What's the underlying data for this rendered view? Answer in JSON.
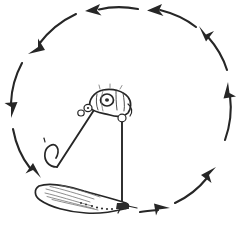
{
  "figure": {
    "title": "Hand-drawn illustration of a suspended artificial fly with a circular arrow diagram",
    "background_color": "#ffffff",
    "ink_color": "#262626",
    "shading_color": "#6a6a6a",
    "canvas": {
      "width": 242,
      "height": 229
    }
  },
  "rotation": {
    "direction": "counterclockwise",
    "arrow_count": 8,
    "ring_center_x": 121,
    "ring_center_y": 116,
    "ring_radius_x": 108,
    "ring_radius_y": 106,
    "arrows": [
      {
        "id": "arrow-top-right",
        "position": "top-right",
        "points": "left",
        "angle_deg": 62
      },
      {
        "id": "arrow-top-center",
        "position": "top-center",
        "points": "left",
        "angle_deg": 95
      },
      {
        "id": "arrow-top-left",
        "position": "top-left",
        "points": "down-left",
        "angle_deg": 135
      },
      {
        "id": "arrow-left-upper",
        "position": "left-upper",
        "points": "down",
        "angle_deg": 172
      },
      {
        "id": "arrow-left-lower",
        "position": "left-lower",
        "points": "down-right",
        "angle_deg": 212
      },
      {
        "id": "arrow-bottom-right",
        "position": "bottom-right",
        "points": "right",
        "angle_deg": 295
      },
      {
        "id": "arrow-right-lower",
        "position": "right-lower",
        "points": "up-right",
        "angle_deg": 325
      },
      {
        "id": "arrow-right-upper",
        "position": "right-upper",
        "points": "up",
        "angle_deg": 15
      }
    ]
  },
  "subject": {
    "name": "artificial-fly",
    "parts": [
      {
        "id": "thorax",
        "label": "segmented thorax with eye loop",
        "center_x": 108,
        "center_y": 99
      },
      {
        "id": "eye-ring",
        "label": "ring eye",
        "center_x": 107,
        "center_y": 99
      },
      {
        "id": "hook-shank",
        "label": "hook shank",
        "center_x": 72,
        "center_y": 140
      },
      {
        "id": "hook-bend",
        "label": "hook bend and point",
        "center_x": 48,
        "center_y": 153
      },
      {
        "id": "tippet-left",
        "label": "left leader line",
        "center_x": 80,
        "center_y": 135
      },
      {
        "id": "tippet-right",
        "label": "right tippet line",
        "center_x": 120,
        "center_y": 160
      },
      {
        "id": "body-feather",
        "label": "feathered elongated body",
        "center_x": 80,
        "center_y": 197
      },
      {
        "id": "tail-knot",
        "label": "tail tie-off knot",
        "center_x": 122,
        "center_y": 207
      }
    ]
  }
}
